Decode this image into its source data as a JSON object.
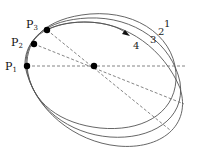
{
  "diagram": {
    "width": 198,
    "height": 150,
    "colors": {
      "curve": "#555555",
      "dash": "#666666",
      "point": "#000000",
      "text": "#111111"
    },
    "center": {
      "x": 94,
      "y": 66
    },
    "points": [
      {
        "id": "P1",
        "letter": "P",
        "sub": "1",
        "x": 27,
        "y": 66,
        "label_x": 2,
        "label_y": 70
      },
      {
        "id": "P2",
        "letter": "P",
        "sub": "2",
        "x": 34,
        "y": 44,
        "label_x": 9,
        "label_y": 44
      },
      {
        "id": "P3",
        "letter": "P",
        "sub": "3",
        "x": 47,
        "y": 30,
        "label_x": 24,
        "label_y": 26
      }
    ],
    "curves": [
      {
        "label": "1",
        "label_x": 166,
        "label_y": 26
      },
      {
        "label": "2",
        "label_x": 159,
        "label_y": 34
      },
      {
        "label": "3",
        "label_x": 150,
        "label_y": 42
      },
      {
        "label": "4",
        "label_x": 133,
        "label_y": 47
      }
    ]
  }
}
